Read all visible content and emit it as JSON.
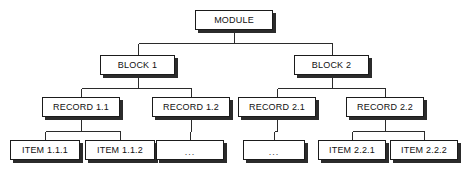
{
  "diagram": {
    "type": "tree",
    "colors": {
      "background": "#ffffff",
      "box_fill": "#ffffff",
      "box_border": "#1b1b1b",
      "box_shadow": "#2b2b2b",
      "connector": "#2b2b2b",
      "text": "#111111"
    },
    "levels": [
      {
        "name": "module",
        "label": "Module"
      },
      {
        "name": "block",
        "label": "Block"
      },
      {
        "name": "record",
        "label": "Record"
      },
      {
        "name": "item",
        "label": "Item"
      }
    ],
    "nodes": [
      {
        "id": "module",
        "label": "MODULE",
        "level": 0,
        "parent": null,
        "x": 195,
        "y": 10,
        "w": 78,
        "h": 20
      },
      {
        "id": "block1",
        "label": "BLOCK 1",
        "level": 1,
        "parent": "module",
        "x": 100,
        "y": 55,
        "w": 75,
        "h": 20
      },
      {
        "id": "block2",
        "label": "BLOCK 2",
        "level": 1,
        "parent": "module",
        "x": 294,
        "y": 55,
        "w": 75,
        "h": 20
      },
      {
        "id": "record11",
        "label": "RECORD 1.1",
        "level": 2,
        "parent": "block1",
        "x": 42,
        "y": 97,
        "w": 78,
        "h": 20
      },
      {
        "id": "record12",
        "label": "RECORD 1.2",
        "level": 2,
        "parent": "block1",
        "x": 152,
        "y": 97,
        "w": 78,
        "h": 20
      },
      {
        "id": "record21",
        "label": "RECORD 2.1",
        "level": 2,
        "parent": "block2",
        "x": 238,
        "y": 97,
        "w": 78,
        "h": 20
      },
      {
        "id": "record22",
        "label": "RECORD 2.2",
        "level": 2,
        "parent": "block2",
        "x": 346,
        "y": 97,
        "w": 78,
        "h": 20
      },
      {
        "id": "item111",
        "label": "ITEM 1.1.1",
        "level": 3,
        "parent": "record11",
        "x": 10,
        "y": 140,
        "w": 70,
        "h": 20
      },
      {
        "id": "item112",
        "label": "ITEM 1.1.2",
        "level": 3,
        "parent": "record11",
        "x": 85,
        "y": 140,
        "w": 70,
        "h": 20
      },
      {
        "id": "ellipsis12",
        "label": "...",
        "level": 3,
        "parent": "record12",
        "x": 156,
        "y": 140,
        "w": 68,
        "h": 20
      },
      {
        "id": "ellipsis21",
        "label": "...",
        "level": 3,
        "parent": "record21",
        "x": 243,
        "y": 140,
        "w": 62,
        "h": 20
      },
      {
        "id": "item221",
        "label": "ITEM 2.2.1",
        "level": 3,
        "parent": "record22",
        "x": 318,
        "y": 140,
        "w": 68,
        "h": 20
      },
      {
        "id": "item222",
        "label": "ITEM 2.2.2",
        "level": 3,
        "parent": "record22",
        "x": 390,
        "y": 140,
        "w": 68,
        "h": 20
      }
    ],
    "edges": [
      {
        "from": "module",
        "to": "block1",
        "bus_y": 43
      },
      {
        "from": "module",
        "to": "block2",
        "bus_y": 43
      },
      {
        "from": "block1",
        "to": "record11",
        "bus_y": 88
      },
      {
        "from": "block1",
        "to": "record12",
        "bus_y": 88
      },
      {
        "from": "block2",
        "to": "record21",
        "bus_y": 88
      },
      {
        "from": "block2",
        "to": "record22",
        "bus_y": 88
      },
      {
        "from": "record11",
        "to": "item111",
        "bus_y": 131
      },
      {
        "from": "record11",
        "to": "item112",
        "bus_y": 131
      },
      {
        "from": "record12",
        "to": "ellipsis12",
        "bus_y": 131
      },
      {
        "from": "record21",
        "to": "ellipsis21",
        "bus_y": 131
      },
      {
        "from": "record22",
        "to": "item221",
        "bus_y": 131
      },
      {
        "from": "record22",
        "to": "item222",
        "bus_y": 131
      }
    ]
  }
}
